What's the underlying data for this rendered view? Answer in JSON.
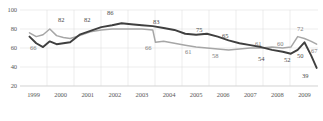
{
  "chart_data": {
    "type": "line",
    "title": "",
    "xlabel": "",
    "ylabel": "",
    "ylim": [
      20,
      100
    ],
    "yticks": [
      100,
      80,
      60,
      40,
      20
    ],
    "grid": true,
    "legend": "none",
    "categories": [
      "1999",
      "2000",
      "2001",
      "2002",
      "2003",
      "2004",
      "2005",
      "2006",
      "2007",
      "2008",
      "2009"
    ],
    "xticks": [
      "1999",
      "2000",
      "2001",
      "2002",
      "2003",
      "2004",
      "2005",
      "2006",
      "2007",
      "2008",
      "2009"
    ],
    "series": [
      {
        "name": "dark-series",
        "color": "#3f3f3f",
        "x": [
          1999.35,
          1999.6,
          1999.85,
          2000.1,
          2000.35,
          2000.6,
          2000.85,
          2001.2,
          2001.6,
          2002.0,
          2002.4,
          2002.75,
          2003.1,
          2003.5,
          2003.9,
          2004.3,
          2004.7,
          2005.1,
          2005.5,
          2005.9,
          2006.3,
          2006.7,
          2007.1,
          2007.5,
          2007.9,
          2008.3,
          2008.7,
          2009.0,
          2009.25,
          2009.5,
          2009.75,
          2009.95
        ],
        "values": [
          72,
          65,
          61,
          67,
          64,
          65,
          66,
          74,
          78,
          82,
          84,
          86,
          85,
          84,
          83,
          81,
          79,
          75,
          74,
          75,
          72,
          68,
          65,
          63,
          61,
          58,
          56,
          54,
          58,
          66,
          52,
          39
        ]
      },
      {
        "name": "gray-series",
        "color": "#a6a6a6",
        "x": [
          1999.35,
          1999.6,
          1999.85,
          2000.1,
          2000.35,
          2000.6,
          2000.85,
          2001.2,
          2001.6,
          2002.0,
          2002.4,
          2002.75,
          2003.1,
          2003.5,
          2003.9,
          2004.0,
          2004.3,
          2004.7,
          2005.1,
          2005.5,
          2005.9,
          2006.3,
          2006.7,
          2007.1,
          2007.5,
          2007.9,
          2008.3,
          2008.7,
          2009.0,
          2009.25,
          2009.5,
          2009.75,
          2009.95
        ],
        "values": [
          76,
          72,
          74,
          80,
          73,
          71,
          70,
          73,
          77,
          79,
          80,
          80,
          80,
          80,
          79,
          66,
          67,
          65,
          63,
          61,
          60,
          59,
          58,
          59,
          60,
          60,
          61,
          60,
          61,
          72,
          70,
          67,
          64
        ]
      }
    ],
    "point_labels": [
      {
        "text": "82",
        "series": "dark-series",
        "x_px": 58,
        "y_px": 17
      },
      {
        "text": "82",
        "series": "dark-series",
        "x_px": 84,
        "y_px": 17
      },
      {
        "text": "86",
        "series": "dark-series",
        "x_px": 107,
        "y_px": 10
      },
      {
        "text": "83",
        "series": "dark-series",
        "x_px": 153,
        "y_px": 19
      },
      {
        "text": "75",
        "series": "dark-series",
        "x_px": 196,
        "y_px": 27
      },
      {
        "text": "65",
        "series": "dark-series",
        "x_px": 222,
        "y_px": 33
      },
      {
        "text": "54",
        "series": "dark-series",
        "x_px": 258,
        "y_px": 56
      },
      {
        "text": "52",
        "series": "dark-series",
        "x_px": 284,
        "y_px": 57
      },
      {
        "text": "39",
        "series": "dark-series",
        "x_px": 302,
        "y_px": 73
      },
      {
        "text": "66",
        "series": "gray-series",
        "x_px": 30,
        "y_px": 45
      },
      {
        "text": "66",
        "series": "gray-series",
        "x_px": 145,
        "y_px": 45
      },
      {
        "text": "61",
        "series": "gray-series",
        "x_px": 185,
        "y_px": 49
      },
      {
        "text": "58",
        "series": "gray-series",
        "x_px": 212,
        "y_px": 53
      },
      {
        "text": "61",
        "series": "gray-series",
        "x_px": 255,
        "y_px": 41
      },
      {
        "text": "60",
        "series": "gray-series",
        "x_px": 277,
        "y_px": 41
      },
      {
        "text": "72",
        "series": "gray-series",
        "x_px": 297,
        "y_px": 26
      },
      {
        "text": "67",
        "series": "gray-series",
        "x_px": 311,
        "y_px": 48
      },
      {
        "text": "50",
        "series": "dark-series",
        "x_px": 297,
        "y_px": 53
      }
    ]
  }
}
